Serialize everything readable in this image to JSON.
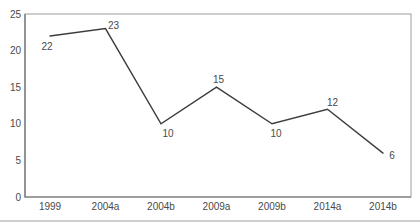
{
  "page": {
    "background_color": "#ffffff",
    "bottom_rule_color": "#cfcfcf"
  },
  "chart_data": {
    "type": "line",
    "title": "",
    "xlabel": "",
    "ylabel": "",
    "categories": [
      "1999",
      "2004a",
      "2004b",
      "2009a",
      "2009b",
      "2014a",
      "2014b"
    ],
    "values": [
      22,
      23,
      10,
      15,
      10,
      12,
      6
    ],
    "point_labels": [
      "22",
      "23",
      "10",
      "15",
      "10",
      "12",
      "6"
    ],
    "label_offsets": [
      [
        -3,
        11
      ],
      [
        8,
        -3
      ],
      [
        7,
        10
      ],
      [
        2,
        -8
      ],
      [
        4,
        10
      ],
      [
        5,
        -7
      ],
      [
        9,
        2
      ]
    ],
    "ylim": [
      0,
      25
    ],
    "yticks": [
      0,
      5,
      10,
      15,
      20,
      25
    ],
    "grid": false,
    "legend": "none",
    "markers": false,
    "colors": {
      "line": "#3d3d3d",
      "box_border": "#9c9c9c",
      "axis": "#6e6e6e",
      "text": "#4a4a4a"
    }
  }
}
